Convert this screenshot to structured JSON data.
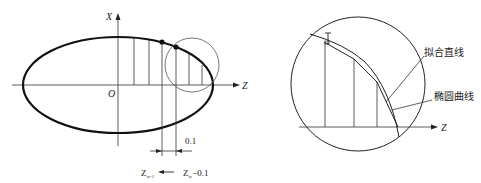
{
  "left_figure": {
    "axis_x_label": "X",
    "axis_z_label": "Z",
    "origin_label": "O",
    "spacing_label": "0.1",
    "bottom_label_left": "Z",
    "bottom_label_left_sub": "w-1",
    "bottom_label_right": "Z",
    "bottom_label_right_sub": "w",
    "bottom_label_right_suffix": "−0.1"
  },
  "right_figure": {
    "axis_z_label": "Z",
    "callout_fit_line": "拟合直线",
    "callout_ellipse_curve": "椭圆曲线"
  }
}
